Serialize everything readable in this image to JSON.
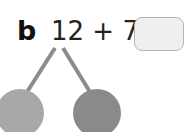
{
  "question": {
    "label": "b",
    "expression": "12 + 7 =",
    "answer_box_value": ""
  },
  "number_bond": {
    "line_color": "#8c8c8c",
    "left_circle_color": "#a8a8a8",
    "right_circle_color": "#8a8a8a"
  }
}
